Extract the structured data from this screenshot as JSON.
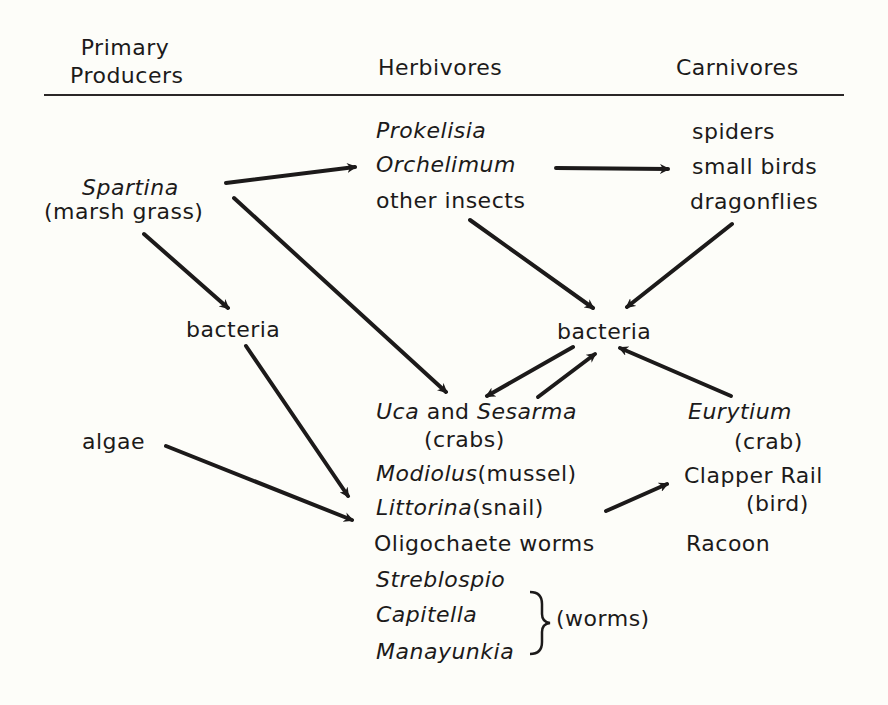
{
  "headers": {
    "producers_line1": "Primary",
    "producers_line2": "Producers",
    "herbivores": "Herbivores",
    "carnivores": "Carnivores"
  },
  "producers": {
    "spartina": "Spartina",
    "spartina_common": "(marsh grass)",
    "bacteria": "bacteria",
    "algae": "algae"
  },
  "herbivores": {
    "prokelisia": "Prokelisia",
    "orchelimum": "Orchelimum",
    "other_insects": "other insects",
    "bacteria": "bacteria",
    "uca": "Uca",
    "and": "and",
    "sesarma": "Sesarma",
    "crabs": "(crabs)",
    "modiolus": "Modiolus",
    "mussel": "(mussel)",
    "littorina": "Littorina",
    "snail": "(snail)",
    "oligochaete": "Oligochaete worms",
    "streblospio": "Streblospio",
    "capitella": "Capitella",
    "manayunkia": "Manayunkia",
    "worms": "(worms)"
  },
  "carnivores": {
    "spiders": "spiders",
    "small_birds": "small birds",
    "dragonflies": "dragonflies",
    "eurytium": "Eurytium",
    "crab": "(crab)",
    "clapper_rail": "Clapper Rail",
    "bird": "(bird)",
    "racoon": "Racoon"
  },
  "colors": {
    "background": "#fdfdf9",
    "ink": "#1c1a1a"
  },
  "arrows": [
    {
      "from": "Spartina",
      "to": "insects"
    },
    {
      "from": "insects",
      "to": "insect predators"
    },
    {
      "from": "Spartina",
      "to": "bacteria (producers)"
    },
    {
      "from": "Spartina",
      "to": "Uca and Sesarma"
    },
    {
      "from": "bacteria (producers)",
      "to": "Modiolus/Littorina"
    },
    {
      "from": "algae",
      "to": "Littorina"
    },
    {
      "from": "other insects",
      "to": "bacteria (herbivores)"
    },
    {
      "from": "dragonflies",
      "to": "bacteria (herbivores)"
    },
    {
      "from": "bacteria (herbivores)",
      "to": "Uca and Sesarma"
    },
    {
      "from": "Uca and Sesarma",
      "to": "bacteria (herbivores)"
    },
    {
      "from": "Eurytium",
      "to": "bacteria (herbivores)"
    },
    {
      "from": "Littorina",
      "to": "Clapper Rail"
    }
  ]
}
